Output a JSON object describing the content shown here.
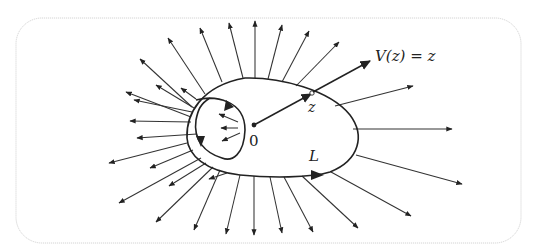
{
  "figure": {
    "labels": {
      "origin": "0",
      "point": "z",
      "field": "V(z) = z",
      "curve": "L"
    },
    "colors": {
      "ink": "#222222",
      "frame": "#d4d4d4",
      "background": "#ffffff"
    },
    "origin": [
      254,
      125
    ],
    "point_z": [
      312,
      93
    ],
    "field_vector_end": [
      372,
      60
    ],
    "outer_curve_orientation": "counterclockwise (arrow on bottom pointing right)",
    "inner_loop_arrows": 3,
    "outer_rays_count": 26
  }
}
